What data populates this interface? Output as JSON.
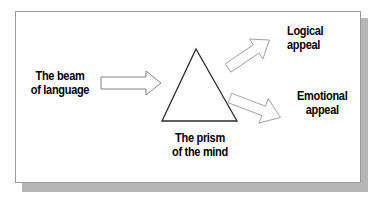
{
  "figure": {
    "background_color": "#ffffff",
    "panel": {
      "fill": "#ffffff",
      "border_color": "#9a9a9a",
      "shadow_color": "#b6b6b6"
    },
    "labels": {
      "beam": {
        "line1": "The beam",
        "line2": "of language"
      },
      "prism": {
        "line1": "The prism",
        "line2": "of the mind"
      },
      "logical": {
        "line1": "Logical",
        "line2": "appeal"
      },
      "emotional": {
        "line1": "Emotional",
        "line2": "appeal"
      }
    },
    "shapes": {
      "triangle": {
        "name": "prism-triangle",
        "stroke": "#2b2b2b",
        "fill": "#ffffff",
        "apex_x": 196,
        "apex_y": 49,
        "base_left_x": 162,
        "base_right_x": 237,
        "base_y": 121
      },
      "arrow_input": {
        "name": "beam-arrow",
        "direction": "right",
        "stroke": "#6e6e6e",
        "fill": "#ffffff"
      },
      "arrow_logical": {
        "name": "logical-arrow",
        "direction": "up-right",
        "angle_deg": -34,
        "stroke": "#9a9a9a",
        "fill": "#ffffff"
      },
      "arrow_emotional": {
        "name": "emotional-arrow",
        "direction": "down-right",
        "angle_deg": 21,
        "stroke": "#9a9a9a",
        "fill": "#ffffff"
      }
    }
  }
}
